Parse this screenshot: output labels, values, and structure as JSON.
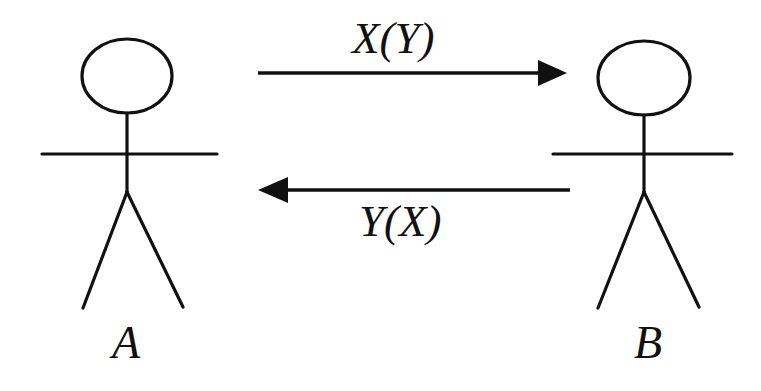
{
  "diagram": {
    "type": "actor-message-diagram",
    "background_color": "#ffffff",
    "stroke_color": "#111111",
    "actors": [
      {
        "id": "actor-a",
        "label": "A",
        "side": "left",
        "head_center_x": 127,
        "head_center_y": 76,
        "head_radius_x": 45,
        "head_radius_y": 37,
        "arms_y": 154,
        "arms_left_x": 42,
        "arms_right_x": 217,
        "hip_y": 192,
        "foot_left_x": 83,
        "foot_right_x": 183,
        "foot_y": 308
      },
      {
        "id": "actor-b",
        "label": "B",
        "side": "right",
        "head_center_x": 644,
        "head_center_y": 78,
        "head_radius_x": 46,
        "head_radius_y": 37,
        "arms_y": 154,
        "arms_left_x": 553,
        "arms_right_x": 732,
        "hip_y": 192,
        "foot_left_x": 598,
        "foot_right_x": 699,
        "foot_y": 308
      }
    ],
    "messages": [
      {
        "id": "message-top",
        "label": "X(Y)",
        "direction": "left-to-right",
        "from": "A",
        "to": "B",
        "line_y": 73,
        "start_x": 258,
        "end_x": 567,
        "label_position": "above"
      },
      {
        "id": "message-bottom",
        "label": "Y(X)",
        "direction": "right-to-left",
        "from": "B",
        "to": "A",
        "line_y": 190,
        "start_x": 570,
        "end_x": 258,
        "label_position": "below"
      }
    ]
  }
}
